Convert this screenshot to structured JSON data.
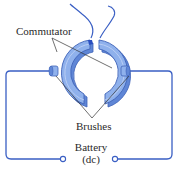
{
  "diagram": {
    "type": "split-ring commutator with brushes connected to dc battery",
    "labels": {
      "commutator": "Commutator",
      "brushes": "Brushes",
      "battery_line1": "Battery",
      "battery_line2": "(dc)"
    },
    "colors": {
      "ring_fill": "#8fb1ec",
      "ring_dark": "#5f86d6",
      "ring_edge": "#3f63b8",
      "wire": "#3a5fc4",
      "leader": "#333333",
      "text": "#2a2a2a"
    }
  }
}
